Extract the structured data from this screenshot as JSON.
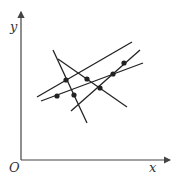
{
  "diagram": {
    "axes": {
      "y_label": "y",
      "x_label": "x",
      "origin_label": "O",
      "color": "#444444"
    },
    "lines": [
      {
        "id": "line-1",
        "x1": 37,
        "y1": 97,
        "x2": 132,
        "y2": 42
      },
      {
        "id": "line-2",
        "x1": 41,
        "y1": 101,
        "x2": 143,
        "y2": 63
      },
      {
        "id": "line-3",
        "x1": 53,
        "y1": 50,
        "x2": 87,
        "y2": 123
      },
      {
        "id": "line-4",
        "x1": 58,
        "y1": 59,
        "x2": 127,
        "y2": 107
      },
      {
        "id": "line-5",
        "x1": 71,
        "y1": 111,
        "x2": 140,
        "y2": 50
      }
    ],
    "points": [
      {
        "x": 66,
        "y": 80
      },
      {
        "x": 87,
        "y": 79
      },
      {
        "x": 57,
        "y": 96
      },
      {
        "x": 74,
        "y": 95
      },
      {
        "x": 100,
        "y": 88
      },
      {
        "x": 113,
        "y": 74
      },
      {
        "x": 124,
        "y": 63
      }
    ],
    "line_color": "#222222",
    "point_color": "#222222"
  }
}
